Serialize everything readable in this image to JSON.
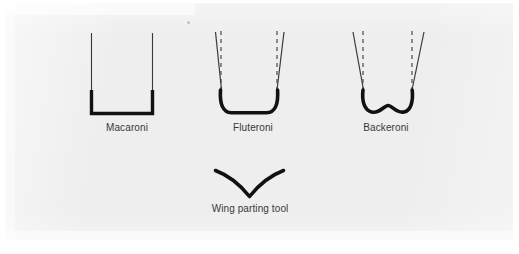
{
  "figure": {
    "type": "technical-line-diagram",
    "background_color": "#eeeeee",
    "ink_color": "#111111",
    "guide_color": "#555555",
    "label_color": "#2a2a2a"
  },
  "diagrams": [
    {
      "id": "macaroni",
      "label": "Macaroni",
      "shape": "square-bottom-U",
      "sides": "vertical",
      "has_guides": false,
      "label_x": 127,
      "label_y": 122
    },
    {
      "id": "fluteroni",
      "label": "Fluteroni",
      "shape": "round-bottom-U",
      "sides": "slightly-flared",
      "has_guides": true,
      "label_x": 253,
      "label_y": 122
    },
    {
      "id": "backeroni",
      "label": "Backeroni",
      "shape": "wavy-bottom-W",
      "sides": "strongly-flared",
      "has_guides": true,
      "label_x": 386,
      "label_y": 122
    },
    {
      "id": "wing-parting-tool",
      "label": "Wing parting tool",
      "shape": "V-curve",
      "sides": "none",
      "has_guides": false,
      "label_x": 250,
      "label_y": 203
    }
  ],
  "labels": {
    "macaroni": "Macaroni",
    "fluteroni": "Fluteroni",
    "backeroni": "Backeroni",
    "wing_parting_tool": "Wing parting tool"
  }
}
